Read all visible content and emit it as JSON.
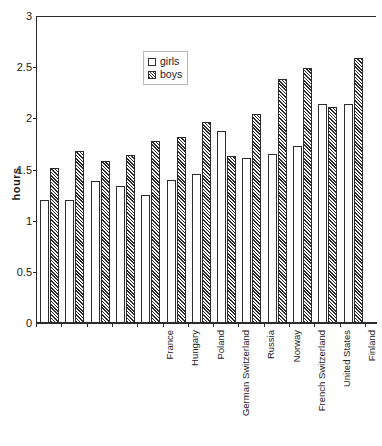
{
  "chart_data": {
    "type": "bar",
    "title": "",
    "xlabel": "",
    "ylabel": "hours",
    "ylim": [
      0,
      3
    ],
    "yticks": [
      "0",
      "0.5",
      "1",
      "1.5",
      "2",
      "2.5",
      "3"
    ],
    "ytick_values": [
      0,
      0.5,
      1,
      1.5,
      2,
      2.5,
      3
    ],
    "grid": false,
    "legend_position": "upper-center",
    "categories": [
      "France",
      "Hungary",
      "Poland",
      "German Switzerland",
      "Russia",
      "Norway",
      "French Switzerland",
      "United States",
      "Finland",
      "Germany",
      "CSFR",
      "Romania",
      "Bulgaria"
    ],
    "series": [
      {
        "name": "girls",
        "values": [
          1.2,
          1.2,
          1.39,
          1.34,
          1.25,
          1.4,
          1.46,
          1.88,
          1.61,
          1.65,
          1.73,
          2.14,
          2.14
        ]
      },
      {
        "name": "boys",
        "values": [
          1.51,
          1.68,
          1.58,
          1.64,
          1.78,
          1.82,
          1.96,
          1.63,
          2.04,
          2.38,
          2.49,
          2.11,
          2.59
        ]
      }
    ]
  },
  "legend": {
    "items": [
      {
        "label": "girls",
        "style": "open"
      },
      {
        "label": "boys",
        "style": "hatched"
      }
    ]
  },
  "colors": {
    "axis": "#2b2b2b",
    "girls_fill": "#ffffff",
    "boys_hatch": "#2b2b2b",
    "background": "#ffffff"
  }
}
